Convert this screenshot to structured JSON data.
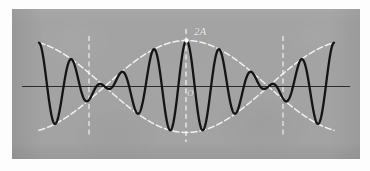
{
  "figure": {
    "plate_color": "#a3a3a3",
    "wave_color": "#141414",
    "envelope_color": "#f5f5f5",
    "axis_color": "#2b2b2b",
    "label_color": "#f2f2f2",
    "background_color": "#fdfdfd"
  },
  "labels": {
    "amplitude_max": "2A",
    "origin": "O"
  },
  "chart_data": {
    "type": "line",
    "xlabel": "",
    "ylabel": "",
    "xlim": [
      -1,
      1
    ],
    "ylim": [
      -1.15,
      1.15
    ],
    "grid": false,
    "legend": false,
    "annotations": [
      {
        "text": "2A",
        "x": 0.0,
        "y": 1.0,
        "note": "maximum amplitude at central antinode"
      },
      {
        "text": "O",
        "x": 0.0,
        "y": 0.0,
        "note": "origin on the horizontal axis"
      }
    ],
    "guides": {
      "horizontal_axis_y": 0.0,
      "vertical_dashed_lines_x": [
        -0.555,
        0.0,
        0.555
      ],
      "node_points_x": [
        -0.555,
        0.555
      ],
      "antinode_point_x": 0.0,
      "envelope_label_point": {
        "x": 0.0,
        "y": 1.0
      }
    },
    "series": [
      {
        "name": "resultant wave",
        "kind": "carrier-with-envelope",
        "color": "#141414",
        "formula": "y = 2A * cos(pi*x/1.11) * cos(9*pi*x)",
        "carrier_cycles_across_width": 18,
        "envelope_half_periods": 2
      },
      {
        "name": "upper envelope",
        "kind": "envelope",
        "style": "dashed",
        "color": "#f5f5f5",
        "formula": "y = 2A * |cos(pi*x/1.11)|"
      },
      {
        "name": "lower envelope",
        "kind": "envelope",
        "style": "dashed",
        "color": "#f5f5f5",
        "formula": "y = -2A * |cos(pi*x/1.11)|"
      }
    ]
  }
}
